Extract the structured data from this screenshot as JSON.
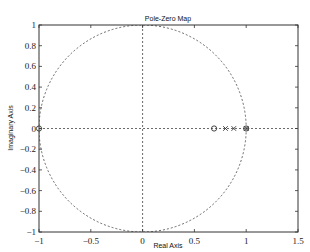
{
  "chart_data": {
    "type": "scatter",
    "title": "Pole-Zero Map",
    "xlabel": "Real Axis",
    "ylabel": "Imaginary Axis",
    "xlim": [
      -1,
      1.5
    ],
    "ylim": [
      -1,
      1
    ],
    "x_ticks": [
      -1,
      -0.5,
      0,
      0.5,
      1,
      1.5
    ],
    "x_tick_labels": [
      "-1",
      "-0.5",
      "0",
      "0.5",
      "1",
      "1.5"
    ],
    "y_ticks": [
      -1,
      -0.8,
      -0.6,
      -0.4,
      -0.2,
      0,
      0.2,
      0.4,
      0.6,
      0.8,
      1
    ],
    "y_tick_labels": [
      "-1",
      "-0.8",
      "-0.6",
      "-0.4",
      "-0.2",
      "0",
      "0.2",
      "0.4",
      "0.6",
      "0.8",
      "1"
    ],
    "grid": false,
    "unit_circle": true,
    "series": [
      {
        "name": "zeros",
        "marker": "o",
        "points": [
          [
            -1,
            0
          ],
          [
            0.69,
            0
          ],
          [
            1.0,
            0
          ]
        ]
      },
      {
        "name": "poles",
        "marker": "x",
        "points": [
          [
            0.8,
            0
          ],
          [
            0.88,
            0
          ],
          [
            1.0,
            0
          ]
        ]
      }
    ],
    "reference_lines": [
      {
        "orientation": "horizontal",
        "value": 0,
        "style": "dotted"
      },
      {
        "orientation": "vertical",
        "value": 0,
        "style": "dotted"
      }
    ]
  },
  "colors": {
    "frame": "#333333",
    "circle": "#444444",
    "markers": "#333333",
    "background": "#ffffff"
  }
}
